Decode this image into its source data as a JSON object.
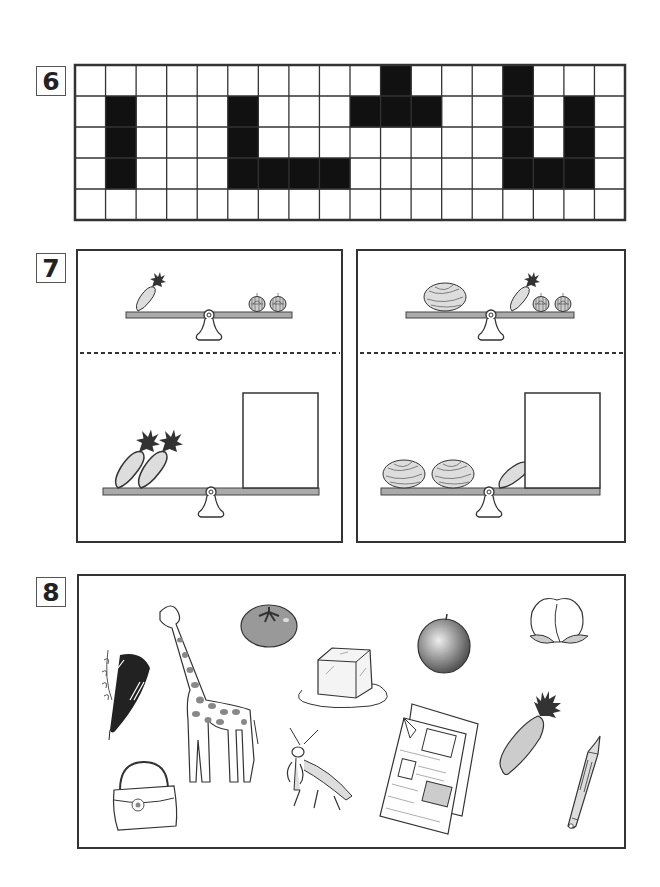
{
  "questions": [
    {
      "number": "6",
      "type": "grid-pattern",
      "grid": {
        "cols": 18,
        "rows": 5,
        "filled_cells": [
          [
            0,
            10
          ],
          [
            0,
            14
          ],
          [
            1,
            1
          ],
          [
            1,
            5
          ],
          [
            1,
            9
          ],
          [
            1,
            10
          ],
          [
            1,
            11
          ],
          [
            1,
            14
          ],
          [
            1,
            16
          ],
          [
            2,
            1
          ],
          [
            2,
            5
          ],
          [
            2,
            14
          ],
          [
            2,
            16
          ],
          [
            3,
            1
          ],
          [
            3,
            5
          ],
          [
            3,
            6
          ],
          [
            3,
            7
          ],
          [
            3,
            8
          ],
          [
            3,
            14
          ],
          [
            3,
            15
          ],
          [
            3,
            16
          ]
        ],
        "fill_color": "#111111",
        "line_color": "#333333"
      }
    },
    {
      "number": "7",
      "type": "balance-scales",
      "panels": [
        {
          "top_scale": {
            "left": [
              "carrot"
            ],
            "right": [
              "onion",
              "onion"
            ]
          },
          "bottom_scale": {
            "left": [
              "carrot",
              "carrot"
            ],
            "right": [
              "answer-box"
            ]
          }
        },
        {
          "top_scale": {
            "left": [
              "cabbage"
            ],
            "right": [
              "carrot",
              "onion",
              "onion"
            ]
          },
          "bottom_scale": {
            "left": [
              "cabbage",
              "cabbage",
              "carrot"
            ],
            "right": [
              "answer-box"
            ]
          }
        }
      ],
      "beam_color": "#aaaaaa"
    },
    {
      "number": "8",
      "type": "picture-collection",
      "items": [
        "woodpecker",
        "giraffe",
        "tomato",
        "ice-cube",
        "apple",
        "peach",
        "handbag",
        "praying-mantis",
        "newspaper",
        "carrot",
        "pencil"
      ]
    }
  ]
}
